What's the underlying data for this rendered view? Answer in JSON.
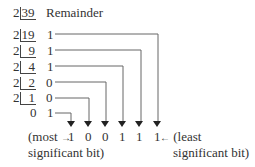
{
  "header": {
    "remainder_label": "Remainder"
  },
  "divisor": "2",
  "rows": [
    {
      "dividend": "39",
      "remainder": ""
    },
    {
      "dividend": "19",
      "remainder": "1"
    },
    {
      "dividend": "9",
      "remainder": "1"
    },
    {
      "dividend": "4",
      "remainder": "1"
    },
    {
      "dividend": "2",
      "remainder": "0"
    },
    {
      "dividend": "1",
      "remainder": "0"
    },
    {
      "dividend": "0",
      "remainder": "1"
    }
  ],
  "result_bits": [
    "1",
    "0",
    "0",
    "1",
    "1",
    "1"
  ],
  "labels": {
    "msb_line1": "(most",
    "msb_line2": "significant bit)",
    "lsb_line1": "(least",
    "lsb_line2": "significant bit)",
    "arrow_right": "→",
    "arrow_left": "←"
  },
  "colors": {
    "text": "#333333",
    "lines": "#555555"
  }
}
